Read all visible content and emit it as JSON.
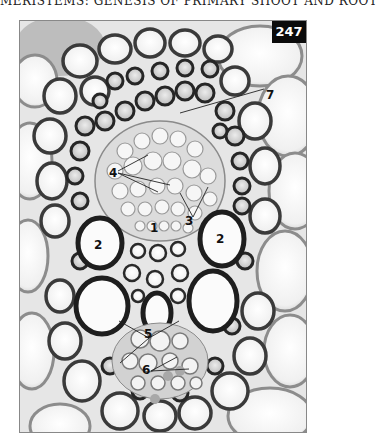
{
  "page": {
    "running_head": "MERISTEMS: GENESIS OF PRIMARY SHOOT AND ROOT",
    "figure_number": "247"
  },
  "figure": {
    "type": "light micrograph, transverse section of vascular bundle",
    "colors": {
      "background": "#f4f4f4",
      "cell_wall_dark": "#2a2a2a",
      "cell_wall_light": "#9a9a9a",
      "lumen": "#fafafa",
      "badge_bg": "#0b0b0b",
      "badge_text": "#ffffff",
      "label_text": "#111111"
    },
    "labels": [
      {
        "id": "label-7",
        "text": "7"
      },
      {
        "id": "label-4",
        "text": "4"
      },
      {
        "id": "label-3",
        "text": "3"
      },
      {
        "id": "label-1",
        "text": "1"
      },
      {
        "id": "label-2a",
        "text": "2"
      },
      {
        "id": "label-2b",
        "text": "2"
      },
      {
        "id": "label-5",
        "text": "5"
      },
      {
        "id": "label-6",
        "text": "6"
      }
    ]
  }
}
